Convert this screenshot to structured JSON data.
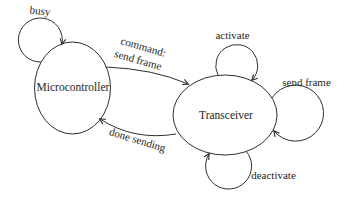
{
  "diagram": {
    "type": "state-diagram",
    "colors": {
      "background": "#ffffff",
      "line": "#2f2f2f",
      "text": "#1e1e1e"
    },
    "nodes": {
      "microcontroller": {
        "label": "Microcontroller"
      },
      "transceiver": {
        "label": "Transceiver"
      }
    },
    "edges": {
      "busy": {
        "label": "busy",
        "from": "Microcontroller",
        "to": "Microcontroller",
        "kind": "self-loop"
      },
      "command_send_frame": {
        "label_line1": "command:",
        "label_line2": "send frame",
        "from": "Microcontroller",
        "to": "Transceiver",
        "kind": "transition"
      },
      "done_sending": {
        "label": "done sending",
        "from": "Transceiver",
        "to": "Microcontroller",
        "kind": "transition"
      },
      "activate": {
        "label": "activate",
        "from": "Transceiver",
        "to": "Transceiver",
        "kind": "self-loop"
      },
      "send_frame": {
        "label": "send frame",
        "from": "Transceiver",
        "to": "Transceiver",
        "kind": "self-loop"
      },
      "deactivate": {
        "label": "deactivate",
        "from": "Transceiver",
        "to": "Transceiver",
        "kind": "self-loop"
      }
    }
  }
}
